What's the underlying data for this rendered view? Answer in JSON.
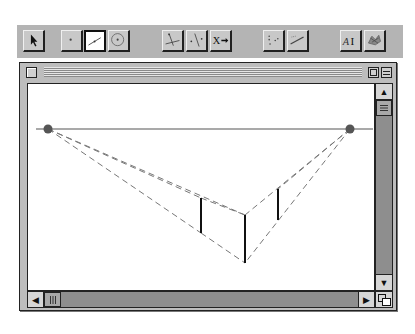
{
  "toolbar": {
    "tools": [
      {
        "id": "select",
        "icon": "arrow-pointer-icon",
        "label": "Select",
        "active": false
      },
      {
        "id": "point",
        "icon": "point-icon",
        "label": "Point",
        "active": false
      },
      {
        "id": "segment",
        "icon": "segment-icon",
        "label": "Segment",
        "active": true
      },
      {
        "id": "circle",
        "icon": "circle-icon",
        "label": "Circle",
        "active": false
      },
      {
        "id": "perpendicular",
        "icon": "perpendicular-line-icon",
        "label": "Perpendicular",
        "active": false
      },
      {
        "id": "parallel",
        "icon": "parallel-line-icon",
        "label": "Parallel",
        "active": false
      },
      {
        "id": "transform",
        "icon": "transform-x-arrow-icon",
        "label": "X→",
        "active": false
      },
      {
        "id": "measure",
        "icon": "measure-points-icon",
        "label": "Measure",
        "active": false
      },
      {
        "id": "graph",
        "icon": "graph-line-icon",
        "label": "Graph",
        "active": false
      },
      {
        "id": "text",
        "icon": "text-label-icon",
        "label": "AI",
        "active": false
      },
      {
        "id": "custom",
        "icon": "custom-tool-icon",
        "label": "Custom",
        "active": false
      }
    ]
  },
  "window": {
    "title": "",
    "close_icon": "close-box-icon",
    "zoom_icon": "zoom-box-icon",
    "collapse_icon": "collapse-box-icon"
  },
  "drawing": {
    "horizon": {
      "x1": 10,
      "y1": 45,
      "x2": 345,
      "y2": 45
    },
    "vanishing_points": [
      {
        "x": 20,
        "y": 45
      },
      {
        "x": 322,
        "y": 45
      }
    ],
    "vertical_edges": [
      {
        "x": 173,
        "y1": 114,
        "y2": 149
      },
      {
        "x": 217,
        "y1": 131,
        "y2": 179
      },
      {
        "x": 250,
        "y1": 105,
        "y2": 136
      }
    ],
    "colors": {
      "line": "#555555",
      "dash": "#777777",
      "edge": "#111111",
      "point": "#555555"
    }
  },
  "scrollbars": {
    "vertical": {
      "up_icon": "scroll-up-arrow-icon",
      "down_icon": "scroll-down-arrow-icon",
      "thumb_icon": "grip-icon"
    },
    "horizontal": {
      "left_icon": "scroll-left-arrow-icon",
      "right_icon": "scroll-right-arrow-icon",
      "thumb_icon": "grip-icon"
    },
    "grow_icon": "resize-grow-icon",
    "arrows": {
      "up": "▲",
      "down": "▼",
      "left": "◀",
      "right": "▶"
    }
  }
}
